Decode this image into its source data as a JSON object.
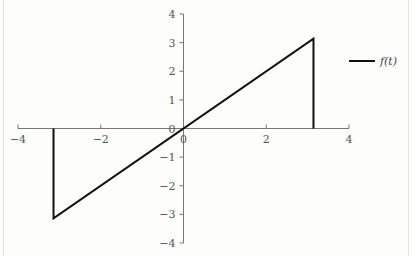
{
  "chart_data": {
    "type": "line",
    "title": "",
    "xlabel": "",
    "ylabel": "",
    "xlim": [
      -4,
      4
    ],
    "ylim": [
      -4,
      4
    ],
    "grid": false,
    "legend_position": "right",
    "x_ticks": [
      -4,
      -2,
      0,
      2,
      4
    ],
    "y_ticks": [
      -4,
      -3,
      -2,
      -1,
      0,
      1,
      2,
      3,
      4
    ],
    "x_tick_labels": [
      "−4",
      "−2",
      "0",
      "2",
      "4"
    ],
    "y_tick_labels": [
      "−4",
      "−3",
      "−2",
      "−1",
      "0",
      "1",
      "2",
      "3",
      "4"
    ],
    "series": [
      {
        "name": "f(t)",
        "color": "#111111",
        "x": [
          -3.1416,
          -3.1416,
          3.1416,
          3.1416
        ],
        "y": [
          0,
          -3.1416,
          3.1416,
          0
        ]
      }
    ]
  },
  "legend": {
    "label": "f(t)"
  }
}
